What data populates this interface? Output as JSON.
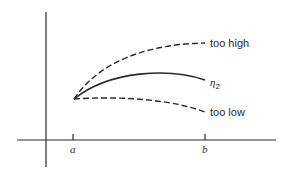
{
  "diagram": {
    "type": "shooting-method-trajectories",
    "axes": {
      "x_ticks": [
        {
          "label": "a",
          "x": 73
        },
        {
          "label": "b",
          "x": 205
        }
      ]
    },
    "curves": [
      {
        "name": "too high",
        "style": "dashed",
        "label": "too high"
      },
      {
        "name": "eta_2",
        "style": "solid",
        "label": "η",
        "subscript": "2"
      },
      {
        "name": "too low",
        "style": "dashed",
        "label": "too low"
      }
    ],
    "colors": {
      "ink": "#2a2a2a",
      "background": "#ffffff"
    }
  }
}
